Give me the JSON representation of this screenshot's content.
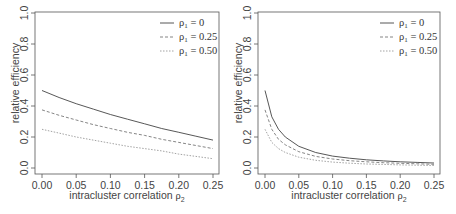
{
  "chart_data": [
    {
      "type": "line",
      "panel": "left",
      "title": "",
      "xlabel": "intracluster correlation ρ2",
      "ylabel": "relative efficiency",
      "xlim": [
        0,
        0.25
      ],
      "ylim": [
        0,
        1.0
      ],
      "xticks": [
        "0.00",
        "0.05",
        "0.10",
        "0.15",
        "0.20",
        "0.25"
      ],
      "yticks": [
        "0.0",
        "0.2",
        "0.4",
        "0.6",
        "0.8",
        "1.0"
      ],
      "grid": false,
      "legend_position": "top-right",
      "x": [
        0.0,
        0.025,
        0.05,
        0.075,
        0.1,
        0.125,
        0.15,
        0.175,
        0.2,
        0.225,
        0.25
      ],
      "series": [
        {
          "name": "ρ1 = 0",
          "style": "solid",
          "values": [
            0.5,
            0.455,
            0.415,
            0.38,
            0.345,
            0.315,
            0.285,
            0.255,
            0.23,
            0.205,
            0.18
          ]
        },
        {
          "name": "ρ1 = 0.25",
          "style": "dashed",
          "values": [
            0.375,
            0.34,
            0.31,
            0.28,
            0.255,
            0.23,
            0.21,
            0.185,
            0.165,
            0.145,
            0.125
          ]
        },
        {
          "name": "ρ1 = 0.50",
          "style": "dotted",
          "values": [
            0.25,
            0.225,
            0.2,
            0.18,
            0.16,
            0.14,
            0.125,
            0.11,
            0.09,
            0.075,
            0.06
          ]
        }
      ]
    },
    {
      "type": "line",
      "panel": "right",
      "title": "",
      "xlabel": "intracluster correlation ρ2",
      "ylabel": "relative efficiency",
      "xlim": [
        0,
        0.25
      ],
      "ylim": [
        0,
        1.0
      ],
      "xticks": [
        "0.00",
        "0.05",
        "0.10",
        "0.15",
        "0.20",
        "0.25"
      ],
      "yticks": [
        "0.0",
        "0.2",
        "0.4",
        "0.6",
        "0.8",
        "1.0"
      ],
      "grid": false,
      "legend_position": "top-right",
      "x": [
        0.0,
        0.01,
        0.02,
        0.03,
        0.05,
        0.075,
        0.1,
        0.125,
        0.15,
        0.175,
        0.2,
        0.225,
        0.25
      ],
      "series": [
        {
          "name": "ρ1 = 0",
          "style": "solid",
          "values": [
            0.5,
            0.33,
            0.25,
            0.2,
            0.14,
            0.1,
            0.077,
            0.063,
            0.053,
            0.046,
            0.04,
            0.036,
            0.032
          ]
        },
        {
          "name": "ρ1 = 0.25",
          "style": "dashed",
          "values": [
            0.375,
            0.25,
            0.185,
            0.15,
            0.105,
            0.075,
            0.058,
            0.047,
            0.04,
            0.034,
            0.03,
            0.027,
            0.024
          ]
        },
        {
          "name": "ρ1 = 0.50",
          "style": "dotted",
          "values": [
            0.25,
            0.165,
            0.125,
            0.1,
            0.07,
            0.05,
            0.038,
            0.031,
            0.026,
            0.023,
            0.02,
            0.018,
            0.016
          ]
        }
      ]
    }
  ],
  "legend": {
    "entries": [
      {
        "symbol": "ρ",
        "sub": "1",
        "value": "= 0"
      },
      {
        "symbol": "ρ",
        "sub": "1",
        "value": "= 0.25"
      },
      {
        "symbol": "ρ",
        "sub": "1",
        "value": "= 0.50"
      }
    ]
  },
  "axes": {
    "xlabel_text": "intracluster correlation ",
    "xlabel_symbol": "ρ",
    "xlabel_sub": "2",
    "ylabel_text": "relative efficiency"
  },
  "colors": {
    "frame": "#555555",
    "series": [
      "#444444",
      "#777777",
      "#999999"
    ]
  }
}
